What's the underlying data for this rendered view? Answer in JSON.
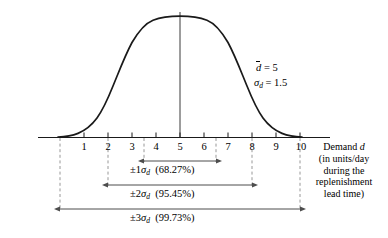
{
  "chart_data": {
    "type": "line",
    "title": "",
    "subtitle": "",
    "curve": "normal-distribution-bell-curve",
    "mean": 5,
    "std_dev": 1.5,
    "xlabel_lines": [
      "Demand d",
      "(in units/day",
      "during the",
      "replenishment",
      "lead time)"
    ],
    "ylabel": "",
    "xlim": [
      0,
      10
    ],
    "grid": false,
    "legend": "none",
    "x_tick_labels": [
      "1",
      "2",
      "3",
      "4",
      "5",
      "6",
      "7",
      "8",
      "9",
      "10"
    ],
    "x_tick_values": [
      1,
      2,
      3,
      4,
      5,
      6,
      7,
      8,
      9,
      10
    ],
    "annotations": {
      "mean_label": "d",
      "mean_equals": "= 5",
      "sigma_label": "σ",
      "sigma_sub": "d",
      "sigma_equals": "= 1.5"
    },
    "intervals": [
      {
        "name": "one-sigma",
        "sigma_prefix": "±1",
        "sigma_symbol": "σ",
        "sigma_sub": "d",
        "percent": "(68.27%)",
        "from": 3.5,
        "to": 6.5
      },
      {
        "name": "two-sigma",
        "sigma_prefix": "±2",
        "sigma_symbol": "σ",
        "sigma_sub": "d",
        "percent": "(95.45%)",
        "from": 2.0,
        "to": 8.0
      },
      {
        "name": "three-sigma",
        "sigma_prefix": "±3",
        "sigma_symbol": "σ",
        "sigma_sub": "d",
        "percent": "(99.73%)",
        "from": 0.5,
        "to": 9.5
      }
    ],
    "colors": {
      "curve": "#1a1a1a",
      "axis": "#1a1a1a",
      "dashed_guide": "#8c8c8c",
      "arrow": "#4d4d4d",
      "background": "#ffffff"
    }
  }
}
